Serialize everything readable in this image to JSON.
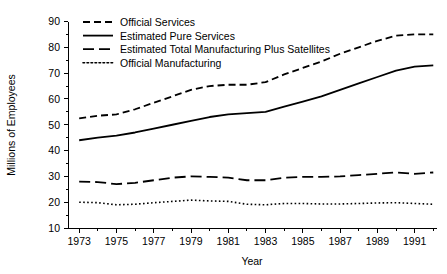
{
  "chart_data": {
    "type": "line",
    "title": "",
    "xlabel": "Year",
    "ylabel": "Millions of Employees",
    "xlim": [
      1972.4,
      1992.2
    ],
    "ylim": [
      10,
      92
    ],
    "grid": false,
    "legend_position": "top-left",
    "x_ticks_major": [
      1973,
      1975,
      1977,
      1979,
      1981,
      1983,
      1985,
      1987,
      1989,
      1991
    ],
    "x_ticks_minor": [
      1974,
      1976,
      1978,
      1980,
      1982,
      1984,
      1986,
      1988,
      1990,
      1992
    ],
    "y_ticks": [
      10,
      20,
      30,
      40,
      50,
      60,
      70,
      80,
      90
    ],
    "x": [
      1973,
      1974,
      1975,
      1976,
      1977,
      1978,
      1979,
      1980,
      1981,
      1982,
      1983,
      1984,
      1985,
      1986,
      1987,
      1988,
      1989,
      1990,
      1991,
      1992
    ],
    "series": [
      {
        "name": "Official Services",
        "dash": "dashed",
        "linewidth": 1.8,
        "values": [
          52.5,
          53.5,
          54.0,
          56.0,
          58.5,
          61.0,
          63.5,
          65.0,
          65.5,
          65.5,
          66.5,
          69.5,
          72.0,
          74.5,
          77.5,
          80.0,
          82.5,
          84.5,
          85.0,
          85.0
        ]
      },
      {
        "name": "Estimated Pure Services",
        "dash": "solid",
        "linewidth": 1.8,
        "values": [
          44.0,
          45.0,
          45.8,
          47.0,
          48.5,
          50.0,
          51.5,
          53.0,
          54.0,
          54.5,
          55.0,
          57.0,
          59.0,
          61.0,
          63.5,
          66.0,
          68.5,
          71.0,
          72.5,
          73.0
        ]
      },
      {
        "name": "Estimated Total Manufacturing Plus Satellites",
        "dash": "longdash",
        "linewidth": 1.8,
        "values": [
          28.0,
          27.8,
          27.0,
          27.5,
          28.5,
          29.5,
          30.0,
          29.8,
          29.5,
          28.5,
          28.5,
          29.5,
          29.8,
          29.8,
          30.0,
          30.5,
          31.0,
          31.5,
          31.0,
          31.5
        ]
      },
      {
        "name": "Official Manufacturing",
        "dash": "dotted",
        "linewidth": 1.6,
        "values": [
          20.0,
          19.8,
          19.0,
          19.2,
          19.8,
          20.3,
          20.8,
          20.5,
          20.3,
          19.2,
          19.0,
          19.5,
          19.5,
          19.3,
          19.3,
          19.5,
          19.7,
          19.8,
          19.5,
          19.2
        ]
      }
    ]
  },
  "legend": {
    "items": [
      {
        "label": "Official Services"
      },
      {
        "label": "Estimated Pure Services"
      },
      {
        "label": "Estimated Total Manufacturing Plus Satellites"
      },
      {
        "label": "Official Manufacturing"
      }
    ]
  },
  "colors": {
    "ink": "#000000",
    "background": "#ffffff"
  }
}
